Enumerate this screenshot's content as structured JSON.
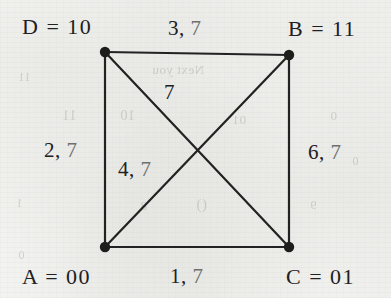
{
  "figure": {
    "type": "undirected-weighted-graph"
  },
  "colors": {
    "paper": "#f6f6f4",
    "ink": "#20201f",
    "faded_ink": "#6f6f6c",
    "edge_stroke": "#222222"
  },
  "vertices": [
    {
      "id": "D",
      "name": "D",
      "separator": "=",
      "code": "10",
      "label": "D = 10",
      "corner": "top-left",
      "x": 105,
      "y": 52
    },
    {
      "id": "B",
      "name": "B",
      "separator": "=",
      "code": "11",
      "label": "B = 11",
      "corner": "top-right",
      "x": 289,
      "y": 55
    },
    {
      "id": "A",
      "name": "A",
      "separator": "=",
      "code": "00",
      "label": "A = 00",
      "corner": "bottom-left",
      "x": 105,
      "y": 247
    },
    {
      "id": "C",
      "name": "C",
      "separator": "=",
      "code": "01",
      "label": "C = 01",
      "corner": "bottom-right",
      "x": 289,
      "y": 247
    }
  ],
  "edges": [
    {
      "id": "DB",
      "from": "D",
      "to": "B",
      "kind": "side",
      "position": "top",
      "primary": "3",
      "secondary": "7",
      "label": "3, 7"
    },
    {
      "id": "AC",
      "from": "A",
      "to": "C",
      "kind": "side",
      "position": "bottom",
      "primary": "1",
      "secondary": "7",
      "label": "1, 7"
    },
    {
      "id": "DA",
      "from": "D",
      "to": "A",
      "kind": "side",
      "position": "left",
      "primary": "2",
      "secondary": "7",
      "label": "2, 7"
    },
    {
      "id": "BC",
      "from": "B",
      "to": "C",
      "kind": "side",
      "position": "right",
      "primary": "6",
      "secondary": "7",
      "label": "6, 7"
    },
    {
      "id": "AB",
      "from": "A",
      "to": "B",
      "kind": "diagonal",
      "position": "interior-lower",
      "primary": "4",
      "secondary": "7",
      "label": "4, 7"
    },
    {
      "id": "DC",
      "from": "D",
      "to": "C",
      "kind": "diagonal",
      "position": "interior-upper",
      "primary": "",
      "secondary": "7",
      "label": "7"
    }
  ],
  "labels": {
    "vertex_top_left": "D = 10",
    "vertex_top_right": "B = 11",
    "vertex_bottom_left": "A = 00",
    "vertex_bottom_right": "C = 01",
    "edge_top": {
      "primary": "3,",
      "secondary": "7"
    },
    "edge_bottom": {
      "primary": "1,",
      "secondary": "7"
    },
    "edge_left": {
      "primary": "2,",
      "secondary": "7"
    },
    "edge_right": {
      "primary": "6,",
      "secondary": "7"
    },
    "edge_diag_lower": {
      "primary": "4,",
      "secondary": "7"
    },
    "edge_diag_upper": {
      "secondary": "7"
    }
  },
  "ghost_text": [
    {
      "text": "Next you",
      "x": 152,
      "y": 62,
      "size": 13
    },
    {
      "text": "11",
      "x": 62,
      "y": 108,
      "size": 14
    },
    {
      "text": "10",
      "x": 120,
      "y": 108,
      "size": 14
    },
    {
      "text": "01",
      "x": 232,
      "y": 112,
      "size": 13
    },
    {
      "text": "0",
      "x": 330,
      "y": 108,
      "size": 13
    },
    {
      "text": "11",
      "x": 18,
      "y": 70,
      "size": 12
    },
    {
      "text": "1",
      "x": 16,
      "y": 196,
      "size": 12
    },
    {
      "text": "0",
      "x": 18,
      "y": 248,
      "size": 12
    },
    {
      "text": "()",
      "x": 196,
      "y": 196,
      "size": 15
    },
    {
      "text": "8",
      "x": 140,
      "y": 198,
      "size": 13
    },
    {
      "text": "9",
      "x": 310,
      "y": 198,
      "size": 12
    },
    {
      "text": "0",
      "x": 352,
      "y": 154,
      "size": 12
    }
  ]
}
